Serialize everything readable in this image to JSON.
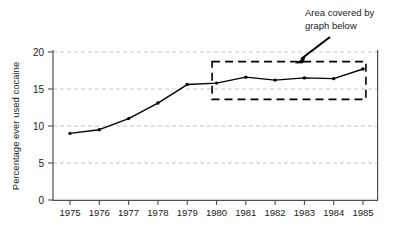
{
  "chart_data": {
    "type": "line",
    "title": "",
    "subtitle": "",
    "xlabel": "",
    "ylabel": "Percentage ever used cocaine",
    "categories": [
      "1975",
      "1976",
      "1977",
      "1978",
      "1979",
      "1980",
      "1981",
      "1982",
      "1983",
      "1984",
      "1985"
    ],
    "x": [
      1975,
      1976,
      1977,
      1978,
      1979,
      1980,
      1981,
      1982,
      1983,
      1984,
      1985
    ],
    "values": [
      9.0,
      9.5,
      11.0,
      13.1,
      15.6,
      15.8,
      16.6,
      16.2,
      16.5,
      16.4,
      17.7
    ],
    "series": [
      {
        "name": "Percentage ever used cocaine",
        "values": [
          9.0,
          9.5,
          11.0,
          13.1,
          15.6,
          15.8,
          16.6,
          16.2,
          16.5,
          16.4,
          17.7
        ]
      }
    ],
    "xlim": [
      1974.5,
      1985.7
    ],
    "ylim": [
      0,
      20
    ],
    "yticks": [
      0,
      5,
      10,
      15,
      20
    ],
    "ytick_labels": [
      "0",
      "5",
      "10",
      "15",
      "20"
    ],
    "xticks": [
      1975,
      1976,
      1977,
      1978,
      1979,
      1980,
      1981,
      1982,
      1983,
      1984,
      1985
    ],
    "grid": true,
    "grid_axis": "y",
    "legend": false,
    "legend_position": "none",
    "marker": "dot",
    "line_color": "#000000",
    "grid_color": "#b9b9b9",
    "axis_color": "#555555",
    "annotations": [
      {
        "name": "area-covered-callout",
        "text_lines": [
          "Area covered by",
          "graph below"
        ],
        "text": "Area covered by graph below",
        "arrow": true,
        "arrow_from_x": 330,
        "arrow_from_y": 38,
        "arrow_to_x": 297,
        "arrow_to_y": 63
      }
    ],
    "highlight_box": {
      "name": "area-covered-box",
      "style": "dashed",
      "x_start": 1979.85,
      "x_end": 1985.1,
      "y_start": 13.6,
      "y_end": 18.7
    }
  },
  "axes": {
    "y_title": "Percentage ever used cocaine",
    "y_tick_labels": [
      "20",
      "15",
      "10",
      "5",
      "0"
    ],
    "x_tick_labels": [
      "1975",
      "1976",
      "1977",
      "1978",
      "1979",
      "1980",
      "1981",
      "1982",
      "1983",
      "1984",
      "1985"
    ]
  },
  "callout": {
    "line1": "Area covered by",
    "line2": "graph below"
  }
}
